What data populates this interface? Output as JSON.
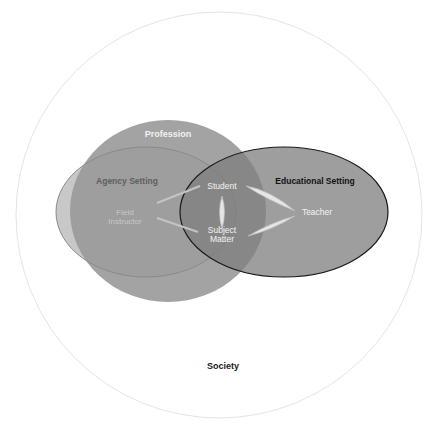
{
  "diagram": {
    "type": "venn-diagram",
    "outer": {
      "label": "Society",
      "color": "#ffffff",
      "stroke": "#e6e6e6"
    },
    "profession": {
      "label": "Profession",
      "color": "#9d9d9d"
    },
    "agency_setting": {
      "label": "Agency Setting",
      "color": "#a8a8a8"
    },
    "educational_setting": {
      "label": "Educational Setting",
      "color": "#8f8f8f",
      "stroke": "#1a1a1a"
    },
    "nodes": {
      "student": "Student",
      "subject_matter_line1": "Subject",
      "subject_matter_line2": "Matter",
      "teacher": "Teacher",
      "field_instructor_line1": "Field",
      "field_instructor_line2": "Instructor"
    },
    "connections": [
      {
        "from": "Field Instructor",
        "to": "Student"
      },
      {
        "from": "Field Instructor",
        "to": "Subject Matter"
      },
      {
        "from": "Student",
        "to": "Subject Matter"
      },
      {
        "from": "Student",
        "to": "Teacher"
      },
      {
        "from": "Subject Matter",
        "to": "Teacher"
      }
    ]
  }
}
